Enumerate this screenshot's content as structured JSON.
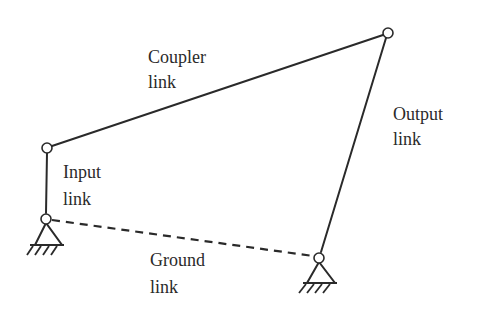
{
  "diagram": {
    "type": "four-bar-linkage",
    "line_color": "#2a2a2a",
    "background": "#ffffff",
    "joints": [
      {
        "id": "A",
        "name": "input-ground-pivot",
        "x": 46,
        "y": 219,
        "grounded": true
      },
      {
        "id": "B",
        "name": "input-coupler-joint",
        "x": 47,
        "y": 148,
        "grounded": false
      },
      {
        "id": "C",
        "name": "coupler-output-joint",
        "x": 388,
        "y": 33,
        "grounded": false
      },
      {
        "id": "D",
        "name": "output-ground-pivot",
        "x": 319,
        "y": 258,
        "grounded": true
      }
    ],
    "links": [
      {
        "name": "input-link",
        "from": "A",
        "to": "B",
        "style": "solid"
      },
      {
        "name": "coupler-link",
        "from": "B",
        "to": "C",
        "style": "solid"
      },
      {
        "name": "output-link",
        "from": "C",
        "to": "D",
        "style": "solid"
      },
      {
        "name": "ground-link",
        "from": "A",
        "to": "D",
        "style": "dashed"
      }
    ],
    "labels": {
      "coupler": {
        "line1": "Coupler",
        "line2": "link"
      },
      "output": {
        "line1": "Output",
        "line2": "link"
      },
      "input": {
        "line1": "Input",
        "line2": "link"
      },
      "ground": {
        "line1": "Ground",
        "line2": "link"
      }
    }
  }
}
